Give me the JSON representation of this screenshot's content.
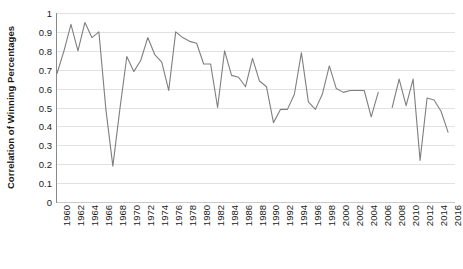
{
  "chart_data": {
    "type": "line",
    "title": "",
    "xlabel": "",
    "ylabel": "Correlation of Winning Percentages",
    "ylim": [
      0,
      1
    ],
    "xlim": [
      1960,
      2017
    ],
    "grid": true,
    "legend": "none",
    "y_ticks": [
      "0",
      "0.1",
      "0.2",
      "0.3",
      "0.4",
      "0.5",
      "0.6",
      "0.7",
      "0.8",
      "0.9",
      "1"
    ],
    "y_tick_values": [
      0,
      0.1,
      0.2,
      0.3,
      0.4,
      0.5,
      0.6,
      0.7,
      0.8,
      0.9,
      1
    ],
    "x_tick_labels": [
      "1960",
      "1962",
      "1964",
      "1966",
      "1968",
      "1970",
      "1972",
      "1974",
      "1976",
      "1978",
      "1980",
      "1982",
      "1984",
      "1986",
      "1988",
      "1990",
      "1992",
      "1994",
      "1996",
      "1998",
      "2000",
      "2002",
      "2004",
      "2006",
      "2008",
      "2010",
      "2012",
      "2014",
      "2016"
    ],
    "x_tick_values": [
      1960,
      1962,
      1964,
      1966,
      1968,
      1970,
      1972,
      1974,
      1976,
      1978,
      1980,
      1982,
      1984,
      1986,
      1988,
      1990,
      1992,
      1994,
      1996,
      1998,
      2000,
      2002,
      2004,
      2006,
      2008,
      2010,
      2012,
      2014,
      2016
    ],
    "line_color": "#7f7f7f",
    "x": [
      1960,
      1961,
      1962,
      1963,
      1964,
      1965,
      1966,
      1967,
      1968,
      1969,
      1970,
      1971,
      1972,
      1973,
      1974,
      1975,
      1976,
      1977,
      1978,
      1979,
      1980,
      1981,
      1982,
      1983,
      1984,
      1985,
      1986,
      1987,
      1988,
      1989,
      1990,
      1991,
      1992,
      1993,
      1994,
      1995,
      1996,
      1997,
      1998,
      1999,
      2000,
      2001,
      2002,
      2003,
      2004,
      2005,
      2006,
      2008,
      2009,
      2010,
      2011,
      2012,
      2013,
      2014,
      2015,
      2016
    ],
    "values": [
      0.68,
      0.8,
      0.94,
      0.8,
      0.95,
      0.87,
      0.9,
      0.49,
      0.19,
      0.49,
      0.77,
      0.69,
      0.75,
      0.87,
      0.78,
      0.74,
      0.59,
      0.9,
      0.87,
      0.85,
      0.84,
      0.73,
      0.73,
      0.5,
      0.8,
      0.67,
      0.66,
      0.61,
      0.76,
      0.64,
      0.61,
      0.42,
      0.49,
      0.49,
      0.57,
      0.79,
      0.53,
      0.49,
      0.57,
      0.72,
      0.6,
      0.58,
      0.59,
      0.59,
      0.59,
      0.45,
      0.58,
      0.5,
      0.65,
      0.51,
      0.65,
      0.22,
      0.55,
      0.54,
      0.48,
      0.37
    ],
    "gaps_after": [
      2006
    ]
  }
}
